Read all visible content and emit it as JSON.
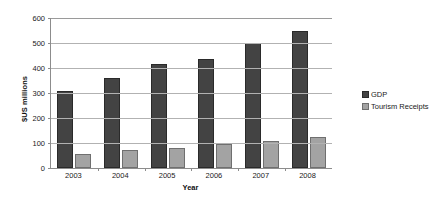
{
  "chart_data": {
    "type": "bar",
    "title": "",
    "xlabel": "Year",
    "ylabel": "$US millions",
    "categories": [
      "2003",
      "2004",
      "2005",
      "2006",
      "2007",
      "2008"
    ],
    "series": [
      {
        "name": "GDP",
        "color": "#434343",
        "values": [
          307,
          360,
          415,
          438,
          500,
          548
        ]
      },
      {
        "name": "Tourism Receipts",
        "color": "#a3a3a3",
        "values": [
          55,
          73,
          81,
          96,
          110,
          125
        ]
      }
    ],
    "ylim": [
      0,
      600
    ],
    "ytick_step": 100,
    "yticks": [
      "0",
      "100",
      "200",
      "300",
      "400",
      "500",
      "600"
    ],
    "grid": "horizontal",
    "legend_position": "right"
  }
}
